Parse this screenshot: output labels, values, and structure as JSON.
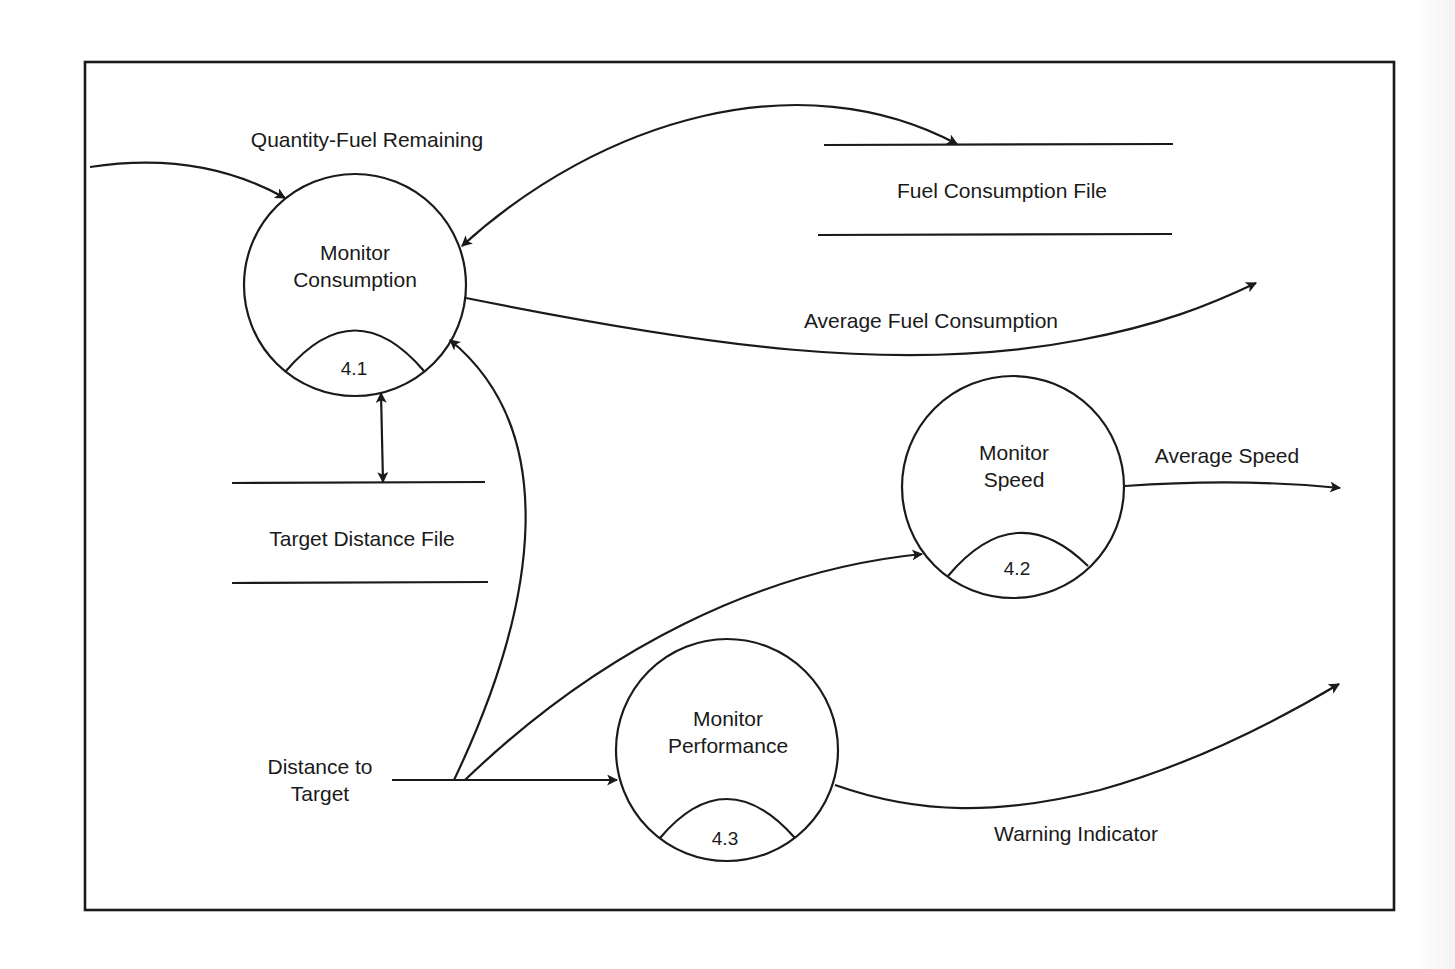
{
  "diagram": {
    "type": "data-flow-diagram",
    "processes": [
      {
        "id": "4.1",
        "number": "4.1",
        "line1": "Monitor",
        "line2": "Consumption"
      },
      {
        "id": "4.2",
        "number": "4.2",
        "line1": "Monitor",
        "line2": "Speed"
      },
      {
        "id": "4.3",
        "number": "4.3",
        "line1": "Monitor",
        "line2": "Performance"
      }
    ],
    "data_stores": [
      {
        "id": "fuel-consumption-file",
        "label": "Fuel Consumption File"
      },
      {
        "id": "target-distance-file",
        "label": "Target Distance File"
      }
    ],
    "flows": [
      {
        "id": "quantity-fuel-remaining",
        "label": "Quantity-Fuel Remaining",
        "from": "external",
        "to": "4.1"
      },
      {
        "id": "fuel-file-exchange",
        "label": "",
        "from": "4.1",
        "to": "fuel-consumption-file",
        "bidirectional": true
      },
      {
        "id": "average-fuel-consumption",
        "label": "Average Fuel Consumption",
        "from": "4.1",
        "to": "external"
      },
      {
        "id": "target-distance-exchange",
        "label": "",
        "from": "4.1",
        "to": "target-distance-file",
        "bidirectional": true
      },
      {
        "id": "average-speed",
        "label": "Average Speed",
        "from": "4.2",
        "to": "external"
      },
      {
        "id": "distance-to-target",
        "label_line1": "Distance to",
        "label_line2": "Target",
        "from": "external",
        "to": [
          "4.1",
          "4.2",
          "4.3"
        ]
      },
      {
        "id": "warning-indicator",
        "label": "Warning Indicator",
        "from": "4.3",
        "to": "external"
      }
    ]
  }
}
